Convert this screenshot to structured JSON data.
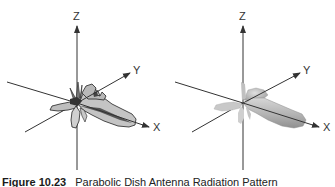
{
  "panels": [
    {
      "name": "outline-pattern",
      "style": "line-drawing",
      "axes": {
        "z": "Z",
        "y": "Y",
        "x": "X"
      }
    },
    {
      "name": "shaded-pattern",
      "style": "shaded-3d",
      "axes": {
        "z": "Z",
        "y": "Y",
        "x": "X"
      }
    }
  ],
  "caption": {
    "figure_number": "Figure 10.23",
    "text": "Parabolic Dish Antenna Radiation Pattern"
  },
  "colors": {
    "axis": "#333333",
    "lobe_fill_light": "#c4c4c4",
    "lobe_fill_dark": "#555555",
    "lobe_outline": "#222222",
    "shaded_lobe": "#b8b8b8"
  }
}
